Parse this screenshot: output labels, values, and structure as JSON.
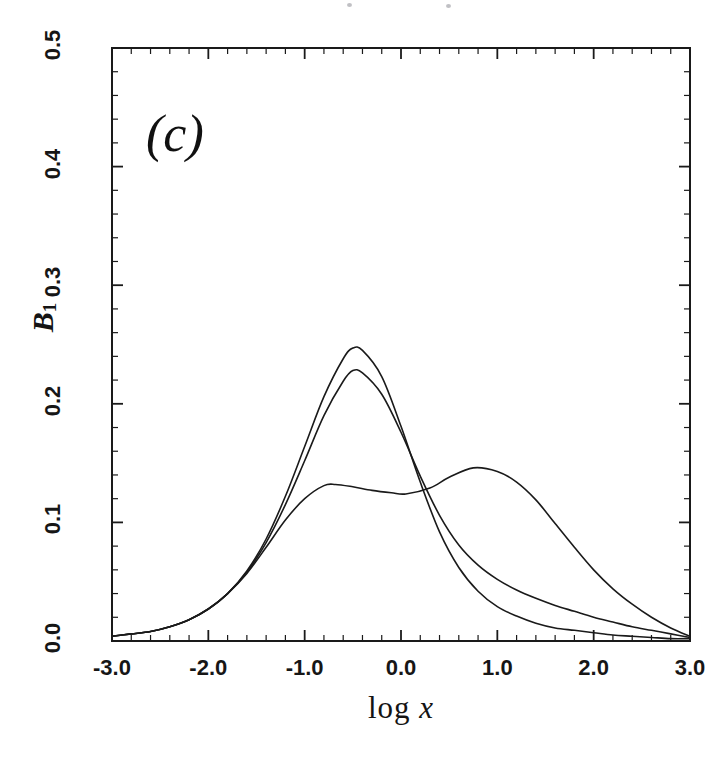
{
  "figure": {
    "panel_label": "(c)",
    "background_color": "#ffffff",
    "ink_color": "#1a1a1a"
  },
  "chart_data": {
    "type": "line",
    "title": "",
    "subtitle": "",
    "panel": "(c)",
    "xlabel": "log x",
    "ylabel": "B1",
    "ylabel_display": "B₁",
    "xlim": [
      -3.0,
      3.0
    ],
    "ylim": [
      0.0,
      0.5
    ],
    "xticks": [
      -3.0,
      -2.0,
      -1.0,
      0.0,
      1.0,
      2.0,
      3.0
    ],
    "xtick_labels": [
      "-3.0",
      "-2.0",
      "-1.0",
      "0.0",
      "1.0",
      "2.0",
      "3.0"
    ],
    "yticks": [
      0.0,
      0.1,
      0.2,
      0.3,
      0.4,
      0.5
    ],
    "ytick_labels": [
      "0.0",
      "0.1",
      "0.2",
      "0.3",
      "0.4",
      "0.5"
    ],
    "x_minor_tick_interval": 0.2,
    "y_minor_tick_interval": 0.02,
    "grid": false,
    "legend": null,
    "legend_position": "none",
    "frame": "box",
    "tick_direction": "in",
    "line_color": "#1a1a1a",
    "line_width": 1.6,
    "series": [
      {
        "name": "curve-1-tall-unimodal",
        "peak_x": -0.48,
        "peak_y": 0.247,
        "x": [
          -3.0,
          -2.8,
          -2.6,
          -2.4,
          -2.2,
          -2.0,
          -1.8,
          -1.6,
          -1.4,
          -1.2,
          -1.0,
          -0.8,
          -0.6,
          -0.5,
          -0.4,
          -0.2,
          0.0,
          0.2,
          0.4,
          0.6,
          0.8,
          1.0,
          1.2,
          1.4,
          1.6,
          1.8,
          2.0,
          2.2,
          2.4,
          2.6,
          2.8,
          3.0
        ],
        "y": [
          0.004,
          0.006,
          0.008,
          0.012,
          0.018,
          0.027,
          0.04,
          0.059,
          0.086,
          0.122,
          0.164,
          0.206,
          0.238,
          0.247,
          0.245,
          0.223,
          0.181,
          0.134,
          0.092,
          0.062,
          0.042,
          0.029,
          0.021,
          0.015,
          0.011,
          0.009,
          0.007,
          0.005,
          0.004,
          0.003,
          0.002,
          0.002
        ]
      },
      {
        "name": "curve-2-unimodal",
        "peak_x": -0.51,
        "peak_y": 0.228,
        "x": [
          -3.0,
          -2.8,
          -2.6,
          -2.4,
          -2.2,
          -2.0,
          -1.8,
          -1.6,
          -1.4,
          -1.2,
          -1.0,
          -0.8,
          -0.6,
          -0.5,
          -0.4,
          -0.2,
          0.0,
          0.2,
          0.4,
          0.6,
          0.8,
          1.0,
          1.2,
          1.4,
          1.6,
          1.8,
          2.0,
          2.2,
          2.4,
          2.6,
          2.8,
          3.0
        ],
        "y": [
          0.004,
          0.006,
          0.008,
          0.012,
          0.018,
          0.027,
          0.04,
          0.058,
          0.083,
          0.115,
          0.152,
          0.19,
          0.219,
          0.228,
          0.226,
          0.208,
          0.176,
          0.139,
          0.106,
          0.081,
          0.064,
          0.052,
          0.043,
          0.036,
          0.03,
          0.025,
          0.02,
          0.016,
          0.012,
          0.009,
          0.006,
          0.003
        ]
      },
      {
        "name": "curve-3-bimodal",
        "peak1_x": -0.68,
        "peak1_y": 0.132,
        "trough_x": 0.05,
        "trough_y": 0.124,
        "peak2_x": 0.75,
        "peak2_y": 0.146,
        "x": [
          -3.0,
          -2.8,
          -2.6,
          -2.4,
          -2.2,
          -2.0,
          -1.8,
          -1.6,
          -1.4,
          -1.2,
          -1.0,
          -0.8,
          -0.68,
          -0.5,
          -0.3,
          -0.1,
          0.05,
          0.3,
          0.5,
          0.75,
          1.0,
          1.2,
          1.4,
          1.6,
          1.8,
          2.0,
          2.2,
          2.4,
          2.6,
          2.8,
          3.0
        ],
        "y": [
          0.004,
          0.006,
          0.008,
          0.012,
          0.018,
          0.027,
          0.04,
          0.057,
          0.079,
          0.102,
          0.12,
          0.131,
          0.132,
          0.13,
          0.127,
          0.125,
          0.124,
          0.129,
          0.138,
          0.146,
          0.143,
          0.134,
          0.119,
          0.099,
          0.079,
          0.06,
          0.044,
          0.031,
          0.02,
          0.011,
          0.004
        ]
      }
    ]
  }
}
